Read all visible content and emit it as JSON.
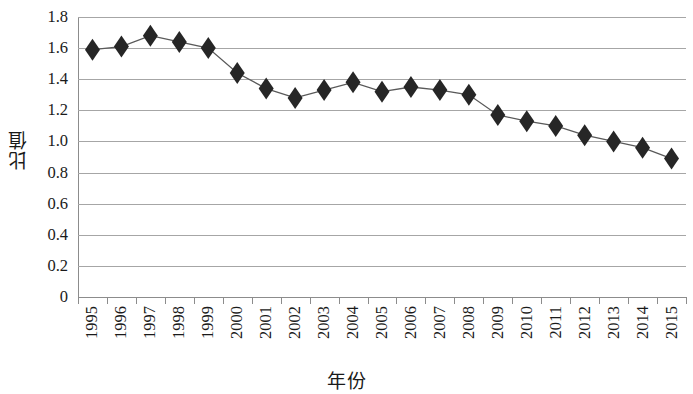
{
  "chart_data": {
    "type": "line",
    "title": "",
    "xlabel": "年份",
    "ylabel": "比值",
    "grid": true,
    "legend": "none",
    "marker": "diamond",
    "marker_color": "#262626",
    "line_color": "#595959",
    "grid_color": "#a6a6a6",
    "axis_color": "#8c8c8c",
    "ylim": [
      0,
      1.8
    ],
    "ytick_step": 0.2,
    "ytick_labels": [
      "1.8",
      "1.6",
      "1.4",
      "1.2",
      "1.0",
      "0.8",
      "0.6",
      "0.4",
      "0.2",
      "0"
    ],
    "ytick_values": [
      1.8,
      1.6,
      1.4,
      1.2,
      1.0,
      0.8,
      0.6,
      0.4,
      0.2,
      0
    ],
    "categories": [
      "1995",
      "1996",
      "1997",
      "1998",
      "1999",
      "2000",
      "2001",
      "2002",
      "2003",
      "2004",
      "2005",
      "2006",
      "2007",
      "2008",
      "2009",
      "2010",
      "2011",
      "2012",
      "2013",
      "2014",
      "2015"
    ],
    "x": [
      1995,
      1996,
      1997,
      1998,
      1999,
      2000,
      2001,
      2002,
      2003,
      2004,
      2005,
      2006,
      2007,
      2008,
      2009,
      2010,
      2011,
      2012,
      2013,
      2014,
      2015
    ],
    "values": [
      1.59,
      1.61,
      1.68,
      1.64,
      1.6,
      1.44,
      1.34,
      1.28,
      1.33,
      1.38,
      1.32,
      1.35,
      1.33,
      1.3,
      1.17,
      1.13,
      1.1,
      1.04,
      1.0,
      0.96,
      0.89
    ],
    "series": [
      {
        "name": "比值",
        "values": [
          1.59,
          1.61,
          1.68,
          1.64,
          1.6,
          1.44,
          1.34,
          1.28,
          1.33,
          1.38,
          1.32,
          1.35,
          1.33,
          1.3,
          1.17,
          1.13,
          1.1,
          1.04,
          1.0,
          0.96,
          0.89
        ]
      }
    ]
  }
}
